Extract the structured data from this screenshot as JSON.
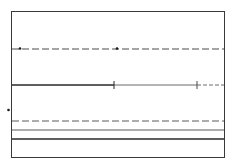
{
  "diagram": {
    "type": "line-style-diagram",
    "colors": {
      "background": "#ffffff",
      "stroke": "#2a2a2a",
      "light_stroke": "#5a5a5a"
    },
    "frame": {
      "x": 11,
      "y": 11,
      "width": 213,
      "height": 146
    },
    "lines": [
      {
        "id": "dash-dot-line",
        "y": 49,
        "style": "dashed",
        "markers_x": [
          20,
          117
        ]
      },
      {
        "id": "segmented-line",
        "y": 85,
        "segments": [
          {
            "x1": 12,
            "x2": 114,
            "style": "solid-thick"
          },
          {
            "x1": 114,
            "x2": 197,
            "style": "solid-thin"
          },
          {
            "x1": 197,
            "x2": 224,
            "style": "dashed"
          }
        ],
        "ticks_x": [
          114,
          197
        ]
      },
      {
        "id": "dashed-line",
        "y": 121,
        "style": "dashed"
      },
      {
        "id": "thin-line",
        "y": 130,
        "style": "solid-thin"
      },
      {
        "id": "thick-line",
        "y": 139,
        "style": "solid-thick"
      }
    ],
    "outside_marker": {
      "x": 8,
      "y": 110
    }
  }
}
